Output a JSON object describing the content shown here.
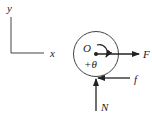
{
  "diagram": {
    "type": "free-body diagram",
    "axes": {
      "y_label": "y",
      "x_label": "x"
    },
    "body": {
      "center_label": "O",
      "rotation_label": "+θ"
    },
    "forces": [
      {
        "label": "F",
        "direction": "right",
        "applied_at": "center"
      },
      {
        "label": "f",
        "direction": "left",
        "applied_at": "bottom contact point"
      },
      {
        "label": "N",
        "direction": "up",
        "applied_at": "bottom contact point"
      }
    ],
    "colors": {
      "stroke": "#222222",
      "background": "#ffffff"
    }
  }
}
